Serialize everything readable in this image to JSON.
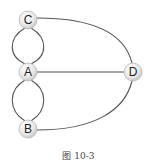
{
  "diagram": {
    "nodes": [
      {
        "id": "C",
        "label": "C"
      },
      {
        "id": "A",
        "label": "A"
      },
      {
        "id": "B",
        "label": "B"
      },
      {
        "id": "D",
        "label": "D"
      }
    ],
    "edges": [
      {
        "from": "C",
        "to": "A",
        "kind": "left-arc"
      },
      {
        "from": "C",
        "to": "A",
        "kind": "right-arc"
      },
      {
        "from": "A",
        "to": "B",
        "kind": "left-arc"
      },
      {
        "from": "A",
        "to": "B",
        "kind": "right-arc"
      },
      {
        "from": "A",
        "to": "D",
        "kind": "straight"
      },
      {
        "from": "C",
        "to": "D",
        "kind": "curve"
      },
      {
        "from": "B",
        "to": "D",
        "kind": "curve"
      }
    ],
    "caption": "图 10-3"
  }
}
